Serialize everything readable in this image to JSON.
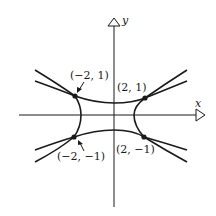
{
  "figure": {
    "axes": {
      "x_label": "x",
      "y_label": "y"
    },
    "points": [
      {
        "label": "(−2, 1)",
        "x": -2,
        "y": 1
      },
      {
        "label": "(2, 1)",
        "x": 2,
        "y": 1
      },
      {
        "label": "(−2, −1)",
        "x": -2,
        "y": -1
      },
      {
        "label": "(2, −1)",
        "x": 2,
        "y": -1
      }
    ],
    "curves": [
      {
        "name": "horizontal-hyperbola",
        "description": "opens left/right"
      },
      {
        "name": "vertical-hyperbola",
        "description": "opens up/down"
      }
    ],
    "colors": {
      "ink": "#1a1a1a",
      "background": "#ffffff"
    }
  }
}
